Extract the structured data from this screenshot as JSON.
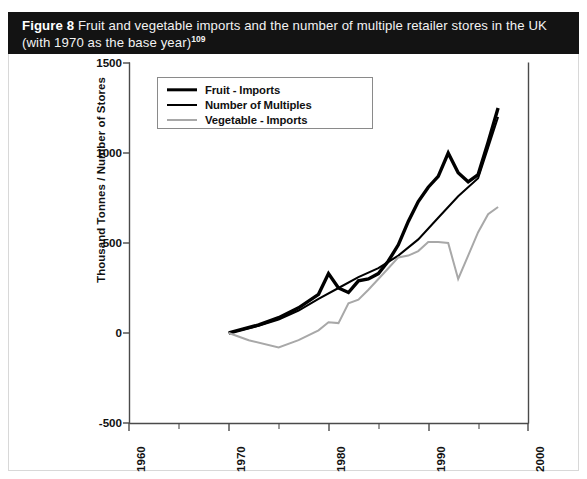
{
  "figure": {
    "label": "Figure 8",
    "title_line1": "Fruit and vegetable imports and the number of multiple retailer stores in the UK",
    "title_line2": "(with 1970 as the base year)",
    "footnote_marker": "109"
  },
  "legend": {
    "position": "top-left-inside",
    "entries": [
      {
        "label": "Fruit - Imports",
        "color": "#000000",
        "width": 3.4,
        "swatch": "line-swatch-fruit"
      },
      {
        "label": "Number of Multiples",
        "color": "#000000",
        "width": 2.0,
        "swatch": "line-swatch-multiples"
      },
      {
        "label": "Vegetable - Imports",
        "color": "#a8a8a8",
        "width": 2.0,
        "swatch": "line-swatch-vegetable"
      }
    ]
  },
  "axes": {
    "y_title": "Thousand Tonnes / Number of Stores",
    "y_ticks": [
      "1500",
      "1000",
      "500",
      "0",
      "-500"
    ],
    "x_ticks": [
      "1960",
      "1970",
      "1980",
      "1990",
      "2000"
    ],
    "x_label": ""
  },
  "chart_data": {
    "type": "line",
    "title": "Fruit and vegetable imports and the number of multiple retailer stores in the UK (with 1970 as the base year)",
    "xlabel": "",
    "ylabel": "Thousand Tonnes / Number of Stores",
    "xlim": [
      1960,
      2000
    ],
    "ylim": [
      -500,
      1500
    ],
    "xticks": [
      1960,
      1970,
      1980,
      1990,
      2000
    ],
    "xminorticks": [
      1965,
      1975,
      1985,
      1995
    ],
    "yticks": [
      -500,
      0,
      500,
      1000,
      1500
    ],
    "grid": false,
    "legend_position": "upper left",
    "series": [
      {
        "name": "Fruit - Imports",
        "color": "#000000",
        "linewidth": 3.4,
        "x": [
          1970,
          1973,
          1975,
          1977,
          1979,
          1980,
          1981,
          1982,
          1983,
          1984,
          1985,
          1986,
          1987,
          1988,
          1989,
          1990,
          1991,
          1992,
          1993,
          1994,
          1995,
          1996,
          1997
        ],
        "y": [
          0,
          45,
          85,
          140,
          215,
          330,
          250,
          225,
          290,
          300,
          330,
          400,
          490,
          620,
          730,
          810,
          870,
          1000,
          890,
          840,
          880,
          1060,
          1250
        ]
      },
      {
        "name": "Number of Multiples",
        "color": "#000000",
        "linewidth": 2.0,
        "x": [
          1970,
          1973,
          1975,
          1977,
          1979,
          1981,
          1983,
          1985,
          1987,
          1989,
          1991,
          1993,
          1995,
          1996,
          1997
        ],
        "y": [
          0,
          40,
          75,
          125,
          190,
          250,
          310,
          360,
          430,
          520,
          640,
          760,
          860,
          1030,
          1200
        ]
      },
      {
        "name": "Vegetable - Imports",
        "color": "#a8a8a8",
        "linewidth": 2.0,
        "x": [
          1970,
          1972,
          1975,
          1977,
          1979,
          1980,
          1981,
          1982,
          1983,
          1984,
          1985,
          1986,
          1987,
          1988,
          1989,
          1990,
          1991,
          1992,
          1993,
          1994,
          1995,
          1996,
          1997
        ],
        "y": [
          0,
          -40,
          -80,
          -40,
          15,
          60,
          55,
          165,
          185,
          240,
          300,
          360,
          420,
          430,
          455,
          505,
          505,
          500,
          300,
          430,
          560,
          660,
          700
        ]
      }
    ]
  }
}
